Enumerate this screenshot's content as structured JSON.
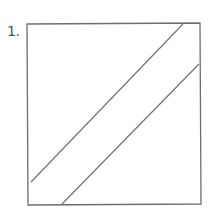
{
  "figure": {
    "label": "1.",
    "stroke_color": "#6e6e6e",
    "box": {
      "x1": 27,
      "y1": 24,
      "x2": 200,
      "y2": 204
    },
    "lines": [
      {
        "x1": 31,
        "y1": 182,
        "x2": 183,
        "y2": 24
      },
      {
        "x1": 62,
        "y1": 204,
        "x2": 199,
        "y2": 64
      }
    ]
  }
}
